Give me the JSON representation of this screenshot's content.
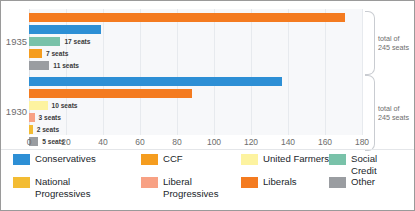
{
  "chart_data": {
    "type": "bar",
    "orientation": "horizontal",
    "title": "",
    "xlabel": "",
    "ylabel": "",
    "xlim": [
      0,
      180
    ],
    "xticks": [
      0,
      20,
      40,
      60,
      80,
      100,
      120,
      140,
      160,
      180
    ],
    "grid": true,
    "legend_position": "bottom",
    "categories": [
      "1935",
      "1930"
    ],
    "groups": [
      {
        "year": "1935",
        "total_note": "total of\n245 seats",
        "bars": [
          {
            "party": "Liberals",
            "value": 171,
            "label": "(King) 171 seats",
            "leader": "King",
            "color": "#f47b20",
            "label_inside": true,
            "label_italic_prefix": true
          },
          {
            "party": "Conservatives",
            "value": 39,
            "label": "39 seats",
            "leader": "",
            "color": "#2d8fd5",
            "label_inside": true,
            "label_italic_prefix": false
          },
          {
            "party": "Social Credit",
            "value": 17,
            "label": "17 seats",
            "leader": "",
            "color": "#79c2a9",
            "label_inside": false,
            "label_italic_prefix": false
          },
          {
            "party": "CCF",
            "value": 7,
            "label": "7 seats",
            "leader": "",
            "color": "#f59d1f",
            "label_inside": false,
            "label_italic_prefix": false
          },
          {
            "party": "Other",
            "value": 11,
            "label": "11 seats",
            "leader": "",
            "color": "#9a9da1",
            "label_inside": false,
            "label_italic_prefix": false
          }
        ]
      },
      {
        "year": "1930",
        "total_note": "total of\n245 seats",
        "bars": [
          {
            "party": "Conservatives",
            "value": 137,
            "label": "(Bennett) 137 seats",
            "leader": "Bennett",
            "color": "#2d8fd5",
            "label_inside": true,
            "label_italic_prefix": true
          },
          {
            "party": "Liberals",
            "value": 88,
            "label": "88 seats",
            "leader": "",
            "color": "#f47b20",
            "label_inside": true,
            "label_italic_prefix": false
          },
          {
            "party": "United Farmers",
            "value": 10,
            "label": "10 seats",
            "leader": "",
            "color": "#fdf3a0",
            "label_inside": false,
            "label_italic_prefix": false
          },
          {
            "party": "Liberal Progressives",
            "value": 3,
            "label": "3 seats",
            "leader": "",
            "color": "#f8a184",
            "label_inside": false,
            "label_italic_prefix": false
          },
          {
            "party": "National Progressives",
            "value": 2,
            "label": "2 seats",
            "leader": "",
            "color": "#f3bc33",
            "label_inside": false,
            "label_italic_prefix": false
          },
          {
            "party": "Other",
            "value": 5,
            "label": "5 seats",
            "leader": "",
            "color": "#9a9da1",
            "label_inside": false,
            "label_italic_prefix": false
          }
        ]
      }
    ],
    "legend": [
      {
        "label": "Conservatives",
        "color": "#2d8fd5"
      },
      {
        "label": "CCF",
        "color": "#f59d1f"
      },
      {
        "label": "United Farmers",
        "color": "#fdf3a0"
      },
      {
        "label": "Social Credit",
        "color": "#79c2a9"
      },
      {
        "label": "National\nProgressives",
        "color": "#f3bc33"
      },
      {
        "label": "Liberal\nProgressives",
        "color": "#f8a184"
      },
      {
        "label": "Liberals",
        "color": "#f47b20"
      },
      {
        "label": "Other",
        "color": "#9a9da1"
      }
    ],
    "annotations": [
      {
        "text": "total of\n245 seats",
        "for": "1935"
      },
      {
        "text": "total of\n245 seats",
        "for": "1930"
      }
    ]
  }
}
